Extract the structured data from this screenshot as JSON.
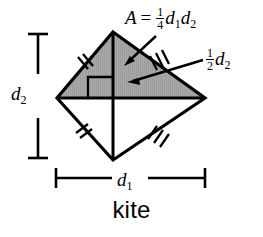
{
  "figure": {
    "shape_name": "kite",
    "caption": "kite",
    "fill_color": "#a9a9a9",
    "stroke_color": "#000000",
    "background": "#ffffff",
    "vertices": {
      "top": {
        "x": 113,
        "y": 32
      },
      "left": {
        "x": 57,
        "y": 98
      },
      "right": {
        "x": 205,
        "y": 98
      },
      "bottom": {
        "x": 113,
        "y": 160
      }
    },
    "shaded_region": "upper-triangle",
    "right_angle_marked": true,
    "tick_marks": {
      "upper_left_edge": 2,
      "lower_left_edge": 2,
      "upper_right_edge": 3,
      "lower_right_edge": 3
    }
  },
  "labels": {
    "area_formula": {
      "var": "A",
      "equals": "=",
      "fraction_numerator": "1",
      "fraction_denominator": "4",
      "d1": "d",
      "d1_sub": "1",
      "d2": "d",
      "d2_sub": "2"
    },
    "half_d2": {
      "fraction_numerator": "1",
      "fraction_denominator": "2",
      "d": "d",
      "d_sub": "2"
    },
    "diagonal_2": {
      "d": "d",
      "sub": "2"
    },
    "diagonal_1": {
      "d": "d",
      "sub": "1"
    },
    "caption": "kite"
  },
  "dimension_lines": {
    "vertical": {
      "label": "d2",
      "x": 38,
      "y_top": 34,
      "y_bottom": 158
    },
    "horizontal": {
      "label": "d1",
      "y": 178,
      "x_left": 56,
      "x_right": 205
    }
  }
}
